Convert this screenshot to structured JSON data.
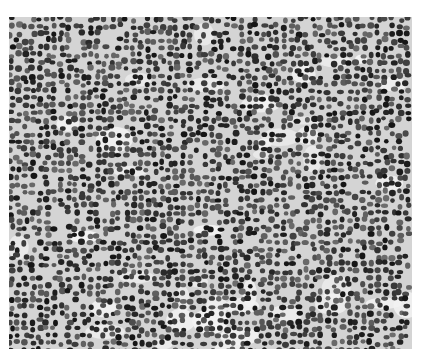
{
  "image": {
    "description": "Grayscale light micrograph of densely packed round lymphoid cell nuclei",
    "alt": "Histology micrograph showing sheets of small dark round cells",
    "colors": {
      "page_background": "#ffffff",
      "stroma": "#e8e8e8",
      "nucleus_dark": "#1c1c1c",
      "nucleus_mid": "#555555"
    }
  }
}
